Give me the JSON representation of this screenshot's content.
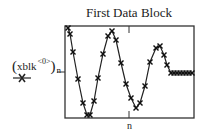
{
  "chart_data": {
    "type": "line",
    "title": "First Data Block",
    "xlabel": "n",
    "ylabel": "(xblk<0>)n",
    "ylabel_parts": {
      "base": "xblk",
      "superscript": "<0>",
      "subscript": "n"
    },
    "legend": [
      {
        "name": "(xblk<0>)n",
        "marker": "x",
        "line": "solid"
      }
    ],
    "grid": false,
    "x_ticks": [
      "tick at center"
    ],
    "y_ticks": [
      "tick at center"
    ],
    "frame_px": {
      "left": 65,
      "top": 26,
      "right": 194,
      "bottom": 118
    },
    "series": [
      {
        "name": "(xblk<0>)n",
        "points_px": [
          [
            68,
            28
          ],
          [
            70,
            34
          ],
          [
            73,
            52
          ],
          [
            78,
            79
          ],
          [
            83,
            103
          ],
          [
            87,
            115
          ],
          [
            90,
            115
          ],
          [
            94,
            101
          ],
          [
            98,
            78
          ],
          [
            103,
            54
          ],
          [
            108,
            36
          ],
          [
            112,
            31
          ],
          [
            116,
            40
          ],
          [
            121,
            63
          ],
          [
            126,
            84
          ],
          [
            131,
            98
          ],
          [
            136,
            108
          ],
          [
            140,
            103
          ],
          [
            145,
            86
          ],
          [
            150,
            62
          ],
          [
            156,
            48
          ],
          [
            160,
            46
          ],
          [
            164,
            55
          ],
          [
            167,
            65
          ],
          [
            171,
            73
          ],
          [
            174,
            73
          ],
          [
            177,
            73
          ],
          [
            180,
            73
          ],
          [
            183,
            73
          ],
          [
            186,
            73
          ],
          [
            189,
            73
          ],
          [
            192,
            73
          ]
        ],
        "description": "Damped oscillation: starts at top, oscillates about two full cycles with decreasing amplitude, then becomes flat constant near the center value."
      }
    ]
  },
  "labels": {
    "title": "First Data Block",
    "y_base": "xblk",
    "y_sup": "<0>",
    "y_sub": "n",
    "x": "n"
  }
}
